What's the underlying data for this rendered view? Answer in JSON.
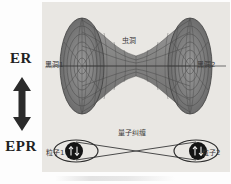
{
  "figure": {
    "left_column": {
      "top_label": "ER",
      "bottom_label": "EPR",
      "connector_icon": "double-headed-vertical-arrow"
    },
    "panel": {
      "background_color": "#e9e7e3",
      "upper_scene": {
        "name": "wormhole-diagram",
        "center_label": "虫洞",
        "left_label": "黑洞1",
        "right_label": "黑洞2",
        "surface_color": "#6f6f6f",
        "mesh_color": "#5a5a5a"
      },
      "lower_scene": {
        "name": "quantum-entanglement-diagram",
        "center_label": "量子纠缠",
        "left_label": "粒子1",
        "right_label": "粒子2",
        "left_particle_icon": "spin-up-down-arrows",
        "right_particle_icon": "spin-up-down-arrows",
        "particle_fill_color": "#1a1a1a",
        "link_color": "#4a4a4a"
      }
    }
  }
}
